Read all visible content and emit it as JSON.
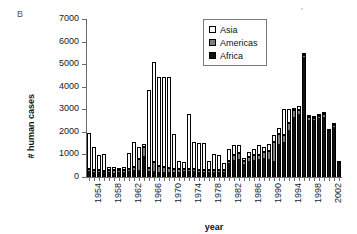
{
  "figure": {
    "panel_label": "B"
  },
  "legend": {
    "position": "top-center-right",
    "entries": [
      {
        "label": "Asia",
        "color": "#ffffff",
        "swatch": "open-square-swatch"
      },
      {
        "label": "Americas",
        "color": "#7d7d7d",
        "swatch": "gray-square-swatch"
      },
      {
        "label": "Africa",
        "color": "#111111",
        "swatch": "black-square-swatch"
      }
    ]
  },
  "axes": {
    "y": {
      "label": "# human cases",
      "ticks": [
        "0",
        "1000",
        "2000",
        "3000",
        "4000",
        "5000",
        "6000",
        "7000"
      ],
      "min": 0,
      "max": 7000,
      "step": 1000
    },
    "x": {
      "label": "year",
      "ticks": [
        "1954",
        "1958",
        "1962",
        "1966",
        "1970",
        "1974",
        "1978",
        "1982",
        "1986",
        "1990",
        "1994",
        "1998",
        "2002"
      ],
      "tick_interval_years": 4,
      "min": 1954,
      "max": 2004
    }
  },
  "chart_data": {
    "type": "bar",
    "stacked": true,
    "title": "",
    "subtitle": "",
    "panel": "B",
    "xlabel": "year",
    "ylabel": "# human cases",
    "ylim": [
      0,
      7000
    ],
    "ytick_step": 1000,
    "xlim": [
      1954,
      2004
    ],
    "grid": false,
    "legend_position": "top-center-right",
    "stack_order_bottom_to_top": [
      "Africa",
      "Americas",
      "Asia"
    ],
    "categories": [
      "1954",
      "1955",
      "1956",
      "1957",
      "1958",
      "1959",
      "1960",
      "1961",
      "1962",
      "1963",
      "1964",
      "1965",
      "1966",
      "1967",
      "1968",
      "1969",
      "1970",
      "1971",
      "1972",
      "1973",
      "1974",
      "1975",
      "1976",
      "1977",
      "1978",
      "1979",
      "1980",
      "1981",
      "1982",
      "1983",
      "1984",
      "1985",
      "1986",
      "1987",
      "1988",
      "1989",
      "1990",
      "1991",
      "1992",
      "1993",
      "1994",
      "1995",
      "1996",
      "1997",
      "1998",
      "1999",
      "2000",
      "2001",
      "2002",
      "2003",
      "2004"
    ],
    "series": [
      {
        "name": "Africa",
        "color": "#111111",
        "values": [
          250,
          240,
          230,
          210,
          230,
          200,
          210,
          230,
          260,
          300,
          330,
          950,
          260,
          250,
          240,
          230,
          230,
          230,
          240,
          250,
          260,
          250,
          240,
          230,
          240,
          230,
          230,
          230,
          600,
          760,
          820,
          560,
          700,
          760,
          780,
          830,
          790,
          700,
          1450,
          1560,
          2100,
          2650,
          2800,
          5300,
          2540,
          2520,
          2600,
          2680,
          1980,
          2220,
          560
        ]
      },
      {
        "name": "Americas",
        "color": "#7d7d7d",
        "values": [
          90,
          90,
          80,
          70,
          80,
          90,
          80,
          80,
          100,
          140,
          460,
          400,
          120,
          430,
          250,
          200,
          180,
          120,
          110,
          100,
          110,
          100,
          90,
          80,
          80,
          80,
          80,
          70,
          120,
          210,
          260,
          130,
          180,
          200,
          210,
          290,
          380,
          870,
          440,
          300,
          280,
          300,
          190,
          120,
          100,
          90,
          90,
          90,
          80,
          80,
          40
        ]
      },
      {
        "name": "Asia",
        "color": "#ffffff",
        "values": [
          1610,
          1020,
          680,
          730,
          130,
          170,
          110,
          130,
          700,
          1120,
          550,
          100,
          3460,
          4400,
          3960,
          4020,
          4040,
          1540,
          350,
          320,
          2430,
          1200,
          1170,
          1190,
          400,
          690,
          650,
          300,
          520,
          430,
          320,
          160,
          220,
          290,
          450,
          220,
          290,
          290,
          300,
          1170,
          630,
          100,
          160,
          80,
          40,
          20,
          20,
          30,
          20,
          20,
          10
        ]
      }
    ],
    "totals": [
      1950,
      1350,
      990,
      1010,
      440,
      460,
      400,
      440,
      1060,
      1560,
      1340,
      1450,
      3840,
      5080,
      4450,
      4450,
      4450,
      1890,
      700,
      670,
      2800,
      1550,
      1500,
      1500,
      720,
      1000,
      960,
      600,
      1240,
      1400,
      1400,
      850,
      1100,
      1250,
      1440,
      1340,
      1460,
      1860,
      2190,
      3030,
      3010,
      3050,
      3150,
      5500,
      2680,
      2630,
      2710,
      2800,
      2080,
      2320,
      610
    ],
    "notable_points": [
      {
        "year": "1966",
        "total": 3840,
        "note": "onset of Asia-driven rise"
      },
      {
        "year": "1967",
        "total": 5080,
        "note": "Asia peak region"
      },
      {
        "year": "1968",
        "total": 4450,
        "note": "plateau"
      },
      {
        "year": "1974",
        "total": 2800,
        "note": "secondary Asia peak"
      },
      {
        "year": "1997",
        "total": 5500,
        "note": "Africa spike"
      }
    ]
  }
}
